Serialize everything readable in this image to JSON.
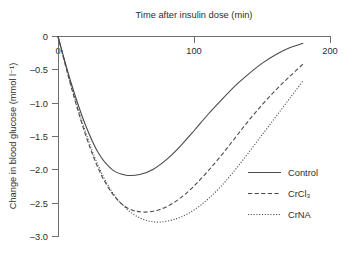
{
  "chart_data": {
    "type": "line",
    "title": "",
    "xlabel": "Time after insulin dose (min)",
    "ylabel": "Change in blood glucose (mmol l⁻¹)",
    "xlim": [
      0,
      200
    ],
    "ylim": [
      -3.0,
      0
    ],
    "grid": false,
    "x_axis_position": "top",
    "legend_position": "inside-right",
    "xticks": [
      0,
      100,
      200
    ],
    "xtick_labels": [
      "0",
      "100",
      "200"
    ],
    "yticks": [
      0,
      -0.5,
      -1.0,
      -1.5,
      -2.0,
      -2.5,
      -3.0
    ],
    "ytick_labels": [
      "0",
      "–0.5",
      "–1.0",
      "–1.5",
      "–2.0",
      "–2.5",
      "–3.0"
    ],
    "x": [
      0,
      10,
      20,
      30,
      40,
      50,
      60,
      70,
      80,
      90,
      100,
      110,
      120,
      130,
      140,
      150,
      160,
      170,
      180
    ],
    "series": [
      {
        "name": "Control",
        "style": "solid",
        "values": [
          0,
          -0.72,
          -1.32,
          -1.76,
          -2.0,
          -2.08,
          -2.07,
          -1.99,
          -1.84,
          -1.64,
          -1.41,
          -1.17,
          -0.95,
          -0.74,
          -0.56,
          -0.4,
          -0.27,
          -0.17,
          -0.1
        ],
        "minimum": -2.08,
        "minimum_at": 50
      },
      {
        "name": "CrCl₃",
        "style": "dashed",
        "values": [
          0,
          -0.78,
          -1.46,
          -2.0,
          -2.36,
          -2.56,
          -2.63,
          -2.62,
          -2.55,
          -2.42,
          -2.24,
          -2.02,
          -1.78,
          -1.52,
          -1.26,
          -1.02,
          -0.8,
          -0.6,
          -0.41
        ],
        "minimum": -2.63,
        "minimum_at": 60
      },
      {
        "name": "CrNA",
        "style": "dotted",
        "values": [
          0,
          -0.76,
          -1.42,
          -1.96,
          -2.34,
          -2.58,
          -2.72,
          -2.78,
          -2.77,
          -2.71,
          -2.6,
          -2.44,
          -2.24,
          -2.0,
          -1.74,
          -1.47,
          -1.2,
          -0.93,
          -0.66
        ],
        "minimum": -2.78,
        "minimum_at": 72
      }
    ]
  },
  "legend": {
    "entries": [
      {
        "label": "Control",
        "style": "solid"
      },
      {
        "label": "CrCl₃",
        "style": "dashed"
      },
      {
        "label": "CrNA",
        "style": "dotted"
      }
    ]
  }
}
